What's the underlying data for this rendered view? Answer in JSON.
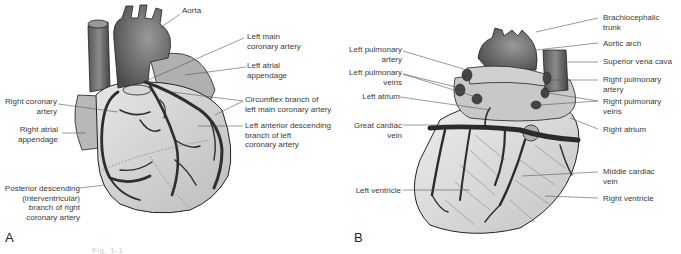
{
  "figure": {
    "panels": [
      {
        "letter": "A",
        "view": "anterior heart with coronary arteries",
        "labels": {
          "aorta": "Aorta",
          "left_main_coronary_artery": "Left main\ncoronary artery",
          "left_atrial_appendage": "Left atrial\nappendage",
          "right_coronary_artery": "Right coronary\nartery",
          "circumflex_branch": "Circumflex branch of\nleft main coronary artery",
          "right_atrial_appendage": "Right atrial\nappendage",
          "left_anterior_descending": "Left anterior descending\nbranch of left\ncoronary artery",
          "posterior_descending": "Posterior descending\n(interventricular)\nbranch of right\ncoronary artery"
        }
      },
      {
        "letter": "B",
        "view": "posterior heart with cardiac veins",
        "labels": {
          "brachiocephalic_trunk": "Brachiocephalic\ntrunk",
          "aortic_arch": "Aortic arch",
          "left_pulmonary_artery": "Left pulmonary\nartery",
          "superior_vena_cava": "Superior vena cava",
          "left_pulmonary_veins": "Left pulmonary\nveins",
          "right_pulmonary_artery": "Right pulmonary\nartery",
          "left_atrium": "Left atrium",
          "right_pulmonary_veins": "Right pulmonary\nveins",
          "great_cardiac_vein": "Great cardiac\nvein",
          "right_atrium": "Right atrium",
          "middle_cardiac_vein": "Middle cardiac\nvein",
          "left_ventricle": "Left ventricle",
          "right_ventricle": "Right ventricle"
        }
      }
    ],
    "caption": "Fig. 1-1"
  },
  "colors": {
    "background": "#ffffff",
    "label_text": "#3a3a3a",
    "leader_line": "#555555",
    "heart_light": "#dcdcdc",
    "heart_mid": "#a8a8a8",
    "vessel_dark": "#2e2e2e",
    "great_vessel": "#6e6e6e"
  }
}
